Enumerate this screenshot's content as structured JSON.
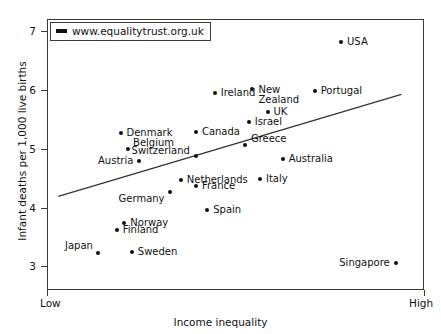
{
  "figure": {
    "legend": {
      "text": "www.equalitytrust.org.uk",
      "marker_name": "line-swatch"
    },
    "axis": {
      "y_title": "Infant deaths per 1,000 live births",
      "x_title": "Income inequality",
      "x_low_label": "Low",
      "x_high_label": "High",
      "y_ticks": [
        "3",
        "4",
        "5",
        "6",
        "7"
      ]
    }
  },
  "chart_data": {
    "type": "scatter",
    "title": "",
    "xlabel": "Income inequality",
    "ylabel": "Infant deaths per 1,000 live births",
    "xlim": [
      0,
      1
    ],
    "ylim": [
      2.6,
      7.2
    ],
    "x_tick_labels": [
      "Low",
      "High"
    ],
    "y_tick_labels": [
      "3",
      "4",
      "5",
      "6",
      "7"
    ],
    "grid": false,
    "legend": "www.equalitytrust.org.uk",
    "legend_position": "upper left",
    "trendline": {
      "type": "linear",
      "x_start": 0.03,
      "y_start": 4.19,
      "x_end": 0.94,
      "y_end": 5.92
    },
    "points": [
      {
        "label": "USA",
        "x": 0.78,
        "y": 6.81
      },
      {
        "label": "Portugal",
        "x": 0.71,
        "y": 5.97
      },
      {
        "label": "New Zealand",
        "x": 0.545,
        "y": 6.02
      },
      {
        "label": "Ireland",
        "x": 0.445,
        "y": 5.95
      },
      {
        "label": "UK",
        "x": 0.585,
        "y": 5.62
      },
      {
        "label": "Israel",
        "x": 0.535,
        "y": 5.45
      },
      {
        "label": "Denmark",
        "x": 0.195,
        "y": 5.27
      },
      {
        "label": "Canada",
        "x": 0.395,
        "y": 5.28
      },
      {
        "label": "Greece",
        "x": 0.525,
        "y": 5.06
      },
      {
        "label": "Belgium",
        "x": 0.215,
        "y": 5.0
      },
      {
        "label": "Switzerland",
        "x": 0.395,
        "y": 4.88
      },
      {
        "label": "Australia",
        "x": 0.625,
        "y": 4.82
      },
      {
        "label": "Austria",
        "x": 0.245,
        "y": 4.79
      },
      {
        "label": "Netherlands",
        "x": 0.355,
        "y": 4.47
      },
      {
        "label": "Italy",
        "x": 0.565,
        "y": 4.48
      },
      {
        "label": "France",
        "x": 0.395,
        "y": 4.36
      },
      {
        "label": "Germany",
        "x": 0.325,
        "y": 4.26
      },
      {
        "label": "Spain",
        "x": 0.425,
        "y": 3.96
      },
      {
        "label": "Norway",
        "x": 0.205,
        "y": 3.73
      },
      {
        "label": "Finland",
        "x": 0.185,
        "y": 3.62
      },
      {
        "label": "Sweden",
        "x": 0.225,
        "y": 3.25
      },
      {
        "label": "Japan",
        "x": 0.135,
        "y": 3.23
      },
      {
        "label": "Singapore",
        "x": 0.925,
        "y": 3.06
      }
    ]
  }
}
